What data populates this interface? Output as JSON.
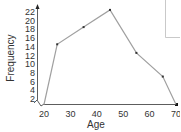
{
  "chart_data": {
    "type": "line",
    "title": "",
    "xlabel": "Age",
    "ylabel": "Frequency",
    "x": [
      20,
      25,
      35,
      45,
      55,
      65,
      70
    ],
    "series": [
      {
        "name": "Frequency polygon",
        "values": [
          0,
          14,
          18,
          22,
          12,
          6.5,
          0
        ]
      }
    ],
    "x_ticks": [
      "20",
      "30",
      "40",
      "50",
      "60",
      "70"
    ],
    "y_ticks": [
      "2",
      "4",
      "6",
      "8",
      "10",
      "12",
      "14",
      "16",
      "18",
      "20",
      "22"
    ],
    "xlim": [
      20,
      70
    ],
    "ylim": [
      0,
      22
    ],
    "grid": false,
    "axis_break": "y-axis zigzag near origin",
    "legend": null,
    "line_color": "#a0a0a0",
    "marker_color": "#333333"
  }
}
